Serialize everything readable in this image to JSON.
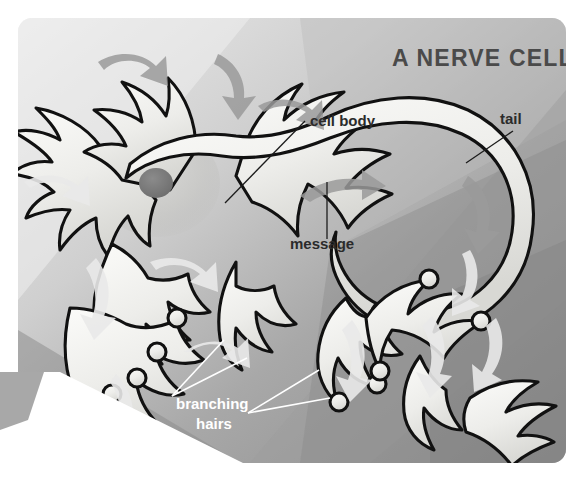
{
  "figure": {
    "title": "A NERVE CELL",
    "panel": {
      "x": 18,
      "y": 18,
      "width": 548,
      "height": 445,
      "radius": 14,
      "bg_light": "#e8e8e8",
      "bg_mid": "#b4b4b4",
      "bg_dark": "#8f8f8f",
      "bg_darkest": "#7c7c7c"
    },
    "page_bg": "#ffffff",
    "corner_wedge": {
      "color": "#ffffff",
      "description": "white triangular page wedge at lower left"
    }
  },
  "labels": [
    {
      "id": "cell-body",
      "text": "cell body",
      "x": 310,
      "y": 126,
      "color": "#2b2b2b",
      "style": "dark"
    },
    {
      "id": "tail",
      "text": "tail",
      "x": 500,
      "y": 124,
      "color": "#2b2b2b",
      "style": "dark"
    },
    {
      "id": "message",
      "text": "message",
      "x": 290,
      "y": 249,
      "color": "#2b2b2b",
      "style": "dark"
    },
    {
      "id": "branching-hairs-1",
      "text": "branching",
      "x": 176,
      "y": 409,
      "color": "#ffffff",
      "style": "light"
    },
    {
      "id": "branching-hairs-2",
      "text": "hairs",
      "x": 196,
      "y": 429,
      "color": "#ffffff",
      "style": "light"
    }
  ],
  "leaders": [
    {
      "id": "cell-body-leader",
      "from": [
        305,
        121
      ],
      "to": [
        225,
        203
      ],
      "style": "dark"
    },
    {
      "id": "tail-leader",
      "from": [
        513,
        131
      ],
      "to": [
        466,
        163
      ],
      "style": "dark"
    },
    {
      "id": "message-leader",
      "from": [
        327,
        239
      ],
      "to": [
        327,
        182
      ],
      "style": "dark"
    },
    {
      "id": "hairs-leader-a",
      "from": [
        172,
        396
      ],
      "to": [
        224,
        340
      ],
      "style": "light"
    },
    {
      "id": "hairs-leader-b",
      "from": [
        172,
        396
      ],
      "to": [
        247,
        358
      ],
      "style": "light"
    },
    {
      "id": "hairs-leader-c",
      "from": [
        248,
        413
      ],
      "to": [
        319,
        370
      ],
      "style": "light"
    },
    {
      "id": "hairs-leader-d",
      "from": [
        248,
        413
      ],
      "to": [
        330,
        398
      ],
      "style": "light"
    }
  ],
  "annotations": {
    "message_arrow": "gray arrow inside axon showing signal direction",
    "flow_arrows": "curved gray and white arrows showing signal flow across dendrites"
  },
  "colors": {
    "cell_fill_light": "#f4f4f2",
    "cell_fill_shadow": "#d2d2ce",
    "outline": "#111111",
    "nucleus": "#7a7a7a",
    "arrow_gray": "#9a9a9a",
    "arrow_white": "#e9e9e9",
    "title_text": "#4a4a4a",
    "label_dark": "#2b2b2b",
    "label_light": "#ffffff"
  }
}
